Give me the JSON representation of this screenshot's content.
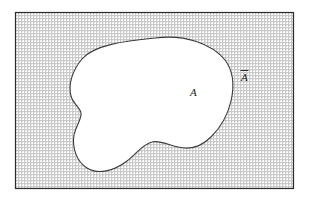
{
  "figure": {
    "universe": {
      "name": "universal-set-rectangle",
      "fill_description": "fine gray cross-hatch shading",
      "border_color": "#2b2b2b",
      "shade_color": "#c9c9c9",
      "background_color": "#ffffff",
      "x": 15,
      "y": 12,
      "width": 279,
      "height": 177
    },
    "set_region": {
      "name": "set-A-blob",
      "fill_color": "#ffffff",
      "outline_color": "#3a3a3a"
    },
    "labels": {
      "set_label": "A",
      "complement_label": "A",
      "complement_has_overbar": true,
      "complement_label_full": "Ā"
    },
    "label_positions": {
      "set_label_x": 193,
      "set_label_y": 95,
      "complement_label_x": 244,
      "complement_label_y": 80
    }
  }
}
